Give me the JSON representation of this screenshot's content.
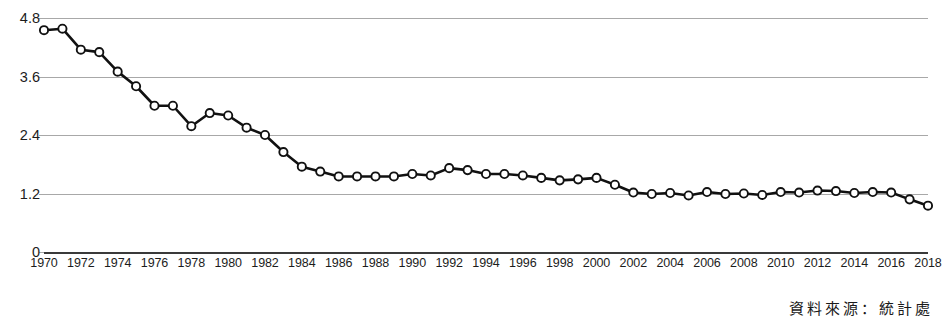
{
  "chart_data": {
    "type": "line",
    "title": "",
    "subtitle": "",
    "xlabel": "",
    "ylabel": "",
    "grid": true,
    "legend": "none",
    "xlim": [
      1970,
      2018
    ],
    "ylim": [
      0,
      4.8
    ],
    "yticks": [
      "0",
      "1.2",
      "2.4",
      "3.6",
      "4.8"
    ],
    "ytick_values": [
      0,
      1.2,
      2.4,
      3.6,
      4.8
    ],
    "xtick_labels": [
      "1970",
      "1972",
      "1974",
      "1976",
      "1978",
      "1980",
      "1982",
      "1984",
      "1986",
      "1988",
      "1990",
      "1992",
      "1994",
      "1996",
      "1998",
      "2000",
      "2002",
      "2004",
      "2006",
      "2008",
      "2010",
      "2012",
      "2014",
      "2016",
      "2018"
    ],
    "xtick_values": [
      1970,
      1972,
      1974,
      1976,
      1978,
      1980,
      1982,
      1984,
      1986,
      1988,
      1990,
      1992,
      1994,
      1996,
      1998,
      2000,
      2002,
      2004,
      2006,
      2008,
      2010,
      2012,
      2014,
      2016,
      2018
    ],
    "marker": "open-circle",
    "line_color": "#111111",
    "marker_fill": "#ffffff",
    "grid_color": "#a8a8a8",
    "axis_color": "#3a3a3a",
    "x": [
      1970,
      1971,
      1972,
      1973,
      1974,
      1975,
      1976,
      1977,
      1978,
      1979,
      1980,
      1981,
      1982,
      1983,
      1984,
      1985,
      1986,
      1987,
      1988,
      1989,
      1990,
      1991,
      1992,
      1993,
      1994,
      1995,
      1996,
      1997,
      1998,
      1999,
      2000,
      2001,
      2002,
      2003,
      2004,
      2005,
      2006,
      2007,
      2008,
      2009,
      2010,
      2011,
      2012,
      2013,
      2014,
      2015,
      2016,
      2017,
      2018
    ],
    "values": [
      4.55,
      4.58,
      4.15,
      4.1,
      3.7,
      3.4,
      3.0,
      3.0,
      2.58,
      2.85,
      2.8,
      2.55,
      2.4,
      2.05,
      1.75,
      1.65,
      1.55,
      1.55,
      1.55,
      1.55,
      1.6,
      1.57,
      1.72,
      1.68,
      1.6,
      1.6,
      1.57,
      1.52,
      1.47,
      1.49,
      1.52,
      1.38,
      1.22,
      1.19,
      1.21,
      1.16,
      1.23,
      1.19,
      1.2,
      1.17,
      1.23,
      1.22,
      1.26,
      1.25,
      1.21,
      1.23,
      1.22,
      1.08,
      0.95
    ],
    "series": [
      {
        "name": "rate",
        "values": [
          4.55,
          4.58,
          4.15,
          4.1,
          3.7,
          3.4,
          3.0,
          3.0,
          2.58,
          2.85,
          2.8,
          2.55,
          2.4,
          2.05,
          1.75,
          1.65,
          1.55,
          1.55,
          1.55,
          1.55,
          1.6,
          1.57,
          1.72,
          1.68,
          1.6,
          1.6,
          1.57,
          1.52,
          1.47,
          1.49,
          1.52,
          1.38,
          1.22,
          1.19,
          1.21,
          1.16,
          1.23,
          1.19,
          1.2,
          1.17,
          1.23,
          1.22,
          1.26,
          1.25,
          1.21,
          1.23,
          1.22,
          1.08,
          0.95
        ]
      }
    ]
  },
  "footer": {
    "source_note": "資料來源：統計處"
  }
}
